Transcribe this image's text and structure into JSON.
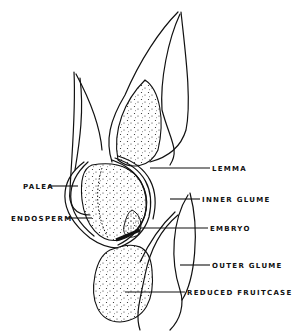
{
  "figure": {
    "colors": {
      "ink": "#111111",
      "background": "#ffffff"
    }
  },
  "labels": {
    "lemma": "LEMMA",
    "inner_glume": "INNER GLUME",
    "embryo": "EMBRYO",
    "outer_glume": "OUTER GLUME",
    "reduced_fruitcase": "REDUCED FRUITCASE",
    "palea": "PALEA",
    "endosperm": "ENDOSPERM"
  }
}
